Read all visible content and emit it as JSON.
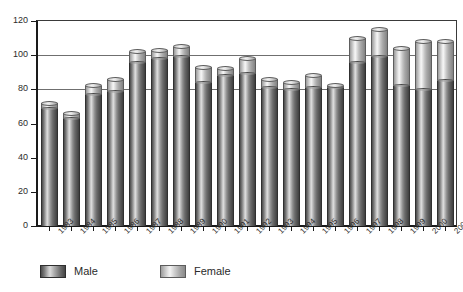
{
  "chart_data": {
    "type": "bar",
    "subtype": "stacked-cylinder",
    "title": "",
    "subtitle": "",
    "xlabel": "",
    "ylabel": "",
    "ylim": [
      0,
      120
    ],
    "ytick_values": [
      0,
      20,
      40,
      60,
      80,
      100,
      120
    ],
    "ytick_labels": [
      "0",
      "20",
      "40",
      "60",
      "80",
      "100",
      "120"
    ],
    "grid": "horizontal-partial",
    "gridlines_at": [
      80,
      100,
      120
    ],
    "legend_position": "bottom-left",
    "categories": [
      "1983",
      "1984",
      "1985",
      "1986",
      "1987",
      "1988",
      "1989",
      "1990",
      "1991",
      "1992",
      "1993",
      "1994",
      "1995",
      "1996",
      "1997",
      "1998",
      "1999",
      "2000",
      "2001"
    ],
    "series": [
      {
        "name": "Male",
        "color": "#777777",
        "values": [
          69,
          63,
          77,
          79,
          96,
          98,
          99,
          84,
          88,
          89,
          81,
          80,
          81,
          81,
          96,
          99,
          82,
          80,
          85
        ]
      },
      {
        "name": "Female",
        "color": "#d8d8d8",
        "values": [
          3,
          3,
          5,
          7,
          6,
          5,
          6,
          9,
          4,
          9,
          5,
          4,
          7,
          1,
          14,
          16,
          22,
          28,
          23
        ]
      }
    ],
    "totals": [
      72,
      66,
      82,
      86,
      102,
      103,
      105,
      93,
      92,
      98,
      86,
      84,
      88,
      82,
      110,
      115,
      104,
      108,
      108
    ]
  },
  "legend": {
    "items": [
      {
        "label": "Male",
        "swatch": "male-swatch"
      },
      {
        "label": "Female",
        "swatch": "female-swatch"
      }
    ]
  },
  "axes": {
    "y_axis_name": "value-axis",
    "x_axis_name": "category-axis"
  }
}
